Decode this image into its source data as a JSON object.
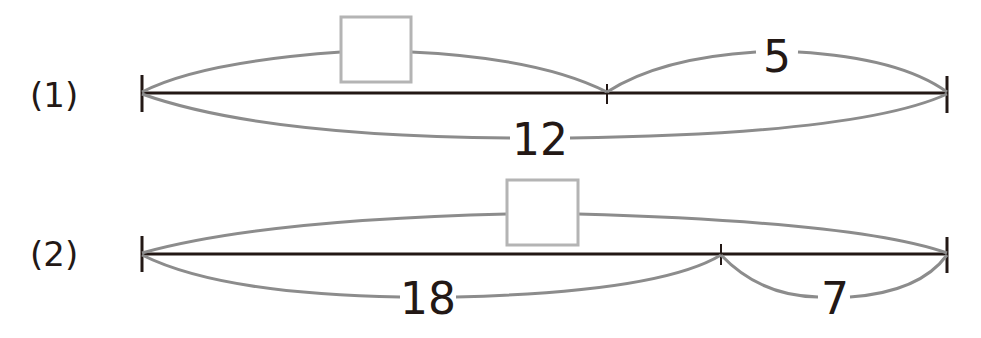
{
  "colors": {
    "line": "#231815",
    "arc": "#8c8c8c",
    "box": "#b4b4b4",
    "background": "#ffffff"
  },
  "problems": [
    {
      "label": "(1)",
      "segments": {
        "left": "□",
        "right": "5"
      },
      "total": "12",
      "unknown": "left"
    },
    {
      "label": "(2)",
      "segments": {
        "left": "18",
        "right": "7"
      },
      "total": "□",
      "unknown": "total"
    }
  ]
}
